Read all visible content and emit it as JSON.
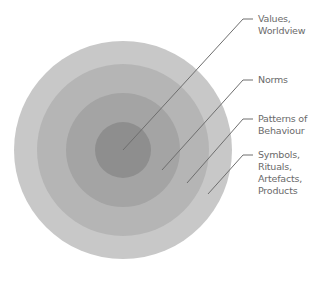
{
  "diagram": {
    "type": "concentric-layers",
    "center": [
      123,
      150
    ],
    "layers": [
      {
        "name": "Symbols, Rituals, Artefacts, Products",
        "radius": 109,
        "color": "#c8c8c8"
      },
      {
        "name": "Patterns of Behaviour",
        "radius": 86,
        "color": "#b5b5b5"
      },
      {
        "name": "Norms",
        "radius": 57,
        "color": "#a4a4a4"
      },
      {
        "name": "Values, Worldview",
        "radius": 28,
        "color": "#8e8e8e"
      }
    ],
    "line_color": "#6e6e6e",
    "labels": [
      {
        "lines": [
          "Values,",
          "Worldview"
        ],
        "anchor": [
          123,
          150
        ],
        "elbow": [
          243,
          19
        ],
        "tick_end": 253,
        "text_pos": [
          258,
          13
        ]
      },
      {
        "lines": [
          "Norms"
        ],
        "anchor": [
          162,
          170
        ],
        "elbow": [
          243,
          80
        ],
        "tick_end": 253,
        "text_pos": [
          258,
          74
        ]
      },
      {
        "lines": [
          "Patterns of",
          "Behaviour"
        ],
        "anchor": [
          187,
          183
        ],
        "elbow": [
          243,
          119
        ],
        "tick_end": 253,
        "text_pos": [
          258,
          113
        ]
      },
      {
        "lines": [
          "Symbols,",
          "Rituals,",
          "Artefacts,",
          "Products"
        ],
        "anchor": [
          208,
          194
        ],
        "elbow": [
          243,
          155
        ],
        "tick_end": 253,
        "text_pos": [
          258,
          149
        ]
      }
    ]
  }
}
